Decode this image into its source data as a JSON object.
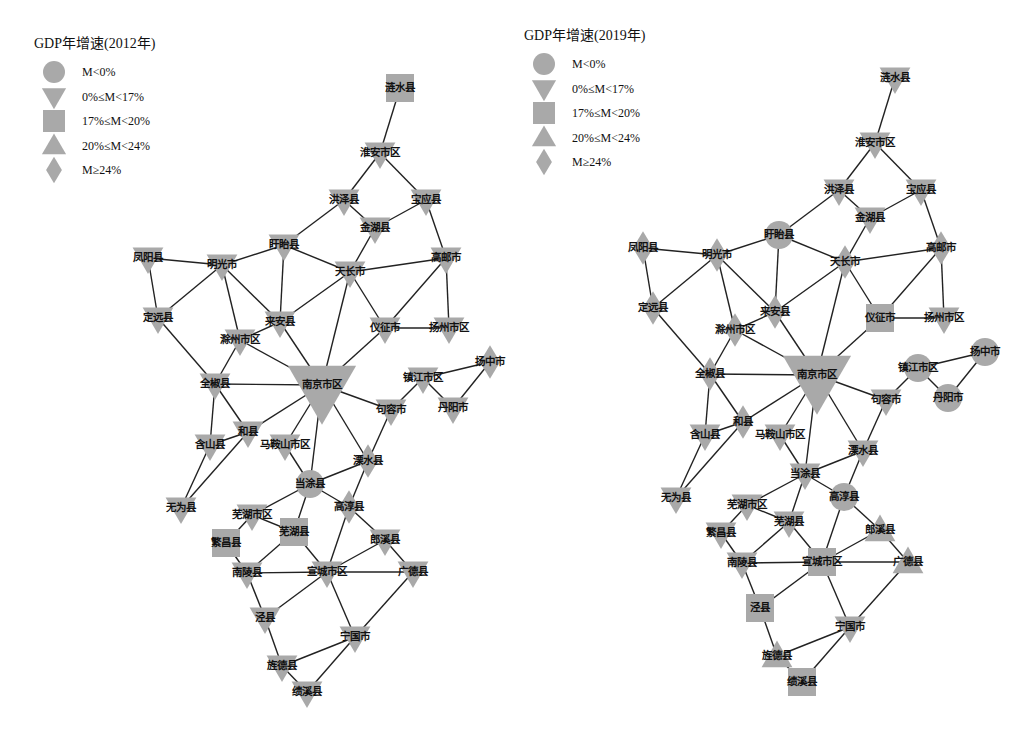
{
  "colors": {
    "node_fill": "#a9a9a9",
    "edge": "#222222",
    "text": "#111111",
    "background": "#ffffff"
  },
  "legend_items": [
    {
      "shape": "circle",
      "label": "M<0%"
    },
    {
      "shape": "triangle-down",
      "label": "0%≤M<17%"
    },
    {
      "shape": "square",
      "label": "17%≤M<20%"
    },
    {
      "shape": "triangle-up",
      "label": "20%≤M<24%"
    },
    {
      "shape": "diamond",
      "label": "M≥24%"
    }
  ],
  "nodes": [
    "涟水县",
    "淮安市区",
    "洪泽县",
    "宝应县",
    "金湖县",
    "盱眙县",
    "凤阳县",
    "明光市",
    "天长市",
    "高邮市",
    "定远县",
    "来安县",
    "滁州市区",
    "仪征市",
    "扬州市区",
    "全椒县",
    "南京市区",
    "镇江市区",
    "扬中市",
    "句容市",
    "丹阳市",
    "和县",
    "含山县",
    "马鞍山市区",
    "溧水县",
    "当涂县",
    "高淳县",
    "无为县",
    "芜湖市区",
    "芜湖县",
    "繁昌县",
    "郎溪县",
    "南陵县",
    "宣城市区",
    "广德县",
    "泾县",
    "宁国市",
    "旌德县",
    "绩溪县"
  ],
  "edges": [
    [
      "涟水县",
      "淮安市区"
    ],
    [
      "淮安市区",
      "洪泽县"
    ],
    [
      "淮安市区",
      "宝应县"
    ],
    [
      "洪泽县",
      "金湖县"
    ],
    [
      "宝应县",
      "金湖县"
    ],
    [
      "宝应县",
      "高邮市"
    ],
    [
      "洪泽县",
      "盱眙县"
    ],
    [
      "金湖县",
      "天长市"
    ],
    [
      "盱眙县",
      "明光市"
    ],
    [
      "盱眙县",
      "天长市"
    ],
    [
      "盱眙县",
      "来安县"
    ],
    [
      "凤阳县",
      "明光市"
    ],
    [
      "凤阳县",
      "定远县"
    ],
    [
      "明光市",
      "定远县"
    ],
    [
      "明光市",
      "滁州市区"
    ],
    [
      "明光市",
      "来安县"
    ],
    [
      "天长市",
      "高邮市"
    ],
    [
      "天长市",
      "来安县"
    ],
    [
      "天长市",
      "仪征市"
    ],
    [
      "天长市",
      "南京市区"
    ],
    [
      "高邮市",
      "仪征市"
    ],
    [
      "高邮市",
      "扬州市区"
    ],
    [
      "仪征市",
      "扬州市区"
    ],
    [
      "仪征市",
      "南京市区"
    ],
    [
      "来安县",
      "滁州市区"
    ],
    [
      "来安县",
      "南京市区"
    ],
    [
      "定远县",
      "全椒县"
    ],
    [
      "滁州市区",
      "全椒县"
    ],
    [
      "滁州市区",
      "南京市区"
    ],
    [
      "全椒县",
      "南京市区"
    ],
    [
      "全椒县",
      "含山县"
    ],
    [
      "全椒县",
      "和县"
    ],
    [
      "和县",
      "含山县"
    ],
    [
      "和县",
      "南京市区"
    ],
    [
      "和县",
      "无为县"
    ],
    [
      "含山县",
      "无为县"
    ],
    [
      "南京市区",
      "马鞍山市区"
    ],
    [
      "南京市区",
      "当涂县"
    ],
    [
      "南京市区",
      "溧水县"
    ],
    [
      "南京市区",
      "句容市"
    ],
    [
      "镇江市区",
      "句容市"
    ],
    [
      "镇江市区",
      "扬中市"
    ],
    [
      "镇江市区",
      "丹阳市"
    ],
    [
      "扬中市",
      "丹阳市"
    ],
    [
      "句容市",
      "溧水县"
    ],
    [
      "马鞍山市区",
      "当涂县"
    ],
    [
      "溧水县",
      "当涂县"
    ],
    [
      "溧水县",
      "高淳县"
    ],
    [
      "当涂县",
      "高淳县"
    ],
    [
      "当涂县",
      "芜湖市区"
    ],
    [
      "当涂县",
      "芜湖县"
    ],
    [
      "芜湖市区",
      "芜湖县"
    ],
    [
      "芜湖市区",
      "繁昌县"
    ],
    [
      "繁昌县",
      "南陵县"
    ],
    [
      "芜湖县",
      "南陵县"
    ],
    [
      "芜湖县",
      "宣城市区"
    ],
    [
      "高淳县",
      "宣城市区"
    ],
    [
      "高淳县",
      "郎溪县"
    ],
    [
      "郎溪县",
      "宣城市区"
    ],
    [
      "郎溪县",
      "广德县"
    ],
    [
      "南陵县",
      "宣城市区"
    ],
    [
      "宣城市区",
      "广德县"
    ],
    [
      "南陵县",
      "泾县"
    ],
    [
      "宣城市区",
      "泾县"
    ],
    [
      "宣城市区",
      "宁国市"
    ],
    [
      "广德县",
      "宁国市"
    ],
    [
      "泾县",
      "旌德县"
    ],
    [
      "宁国市",
      "旌德县"
    ],
    [
      "宁国市",
      "绩溪县"
    ],
    [
      "旌德县",
      "绩溪县"
    ]
  ],
  "panels": [
    {
      "legend_title": "GDP年增速(2012年)",
      "node_categories": {
        "涟水县": "square",
        "淮安市区": "triangle-down",
        "洪泽县": "triangle-down",
        "宝应县": "triangle-down",
        "金湖县": "triangle-down",
        "盱眙县": "triangle-down",
        "凤阳县": "triangle-down",
        "明光市": "triangle-down",
        "天长市": "triangle-down",
        "高邮市": "triangle-down",
        "定远县": "triangle-down",
        "来安县": "triangle-down",
        "滁州市区": "triangle-down",
        "仪征市": "triangle-down",
        "扬州市区": "triangle-down",
        "全椒县": "triangle-down",
        "南京市区": "triangle-down",
        "镇江市区": "triangle-down",
        "扬中市": "diamond",
        "句容市": "triangle-down",
        "丹阳市": "triangle-down",
        "和县": "triangle-down",
        "含山县": "triangle-down",
        "马鞍山市区": "triangle-down",
        "溧水县": "diamond",
        "当涂县": "circle",
        "高淳县": "diamond",
        "无为县": "triangle-down",
        "芜湖市区": "triangle-down",
        "芜湖县": "square",
        "繁昌县": "square",
        "郎溪县": "triangle-down",
        "南陵县": "triangle-down",
        "宣城市区": "triangle-down",
        "广德县": "triangle-down",
        "泾县": "triangle-down",
        "宁国市": "triangle-down",
        "旌德县": "triangle-down",
        "绩溪县": "triangle-down"
      }
    },
    {
      "legend_title": "GDP年增速(2019年)",
      "node_categories": {
        "涟水县": "triangle-down",
        "淮安市区": "triangle-down",
        "洪泽县": "triangle-down",
        "宝应县": "triangle-down",
        "金湖县": "triangle-down",
        "盱眙县": "circle",
        "凤阳县": "diamond",
        "明光市": "diamond",
        "天长市": "diamond",
        "高邮市": "diamond",
        "定远县": "diamond",
        "来安县": "diamond",
        "滁州市区": "diamond",
        "仪征市": "square",
        "扬州市区": "triangle-down",
        "全椒县": "diamond",
        "南京市区": "triangle-down",
        "镇江市区": "circle",
        "扬中市": "circle",
        "句容市": "triangle-down",
        "丹阳市": "circle",
        "和县": "diamond",
        "含山县": "triangle-down",
        "马鞍山市区": "triangle-down",
        "溧水县": "triangle-down",
        "当涂县": "triangle-down",
        "高淳县": "circle",
        "无为县": "triangle-down",
        "芜湖市区": "triangle-down",
        "芜湖县": "triangle-down",
        "繁昌县": "triangle-down",
        "郎溪县": "triangle-up",
        "南陵县": "triangle-down",
        "宣城市区": "square",
        "广德县": "triangle-up",
        "泾县": "square",
        "宁国市": "triangle-down",
        "旌德县": "triangle-up",
        "绩溪县": "square"
      }
    }
  ]
}
